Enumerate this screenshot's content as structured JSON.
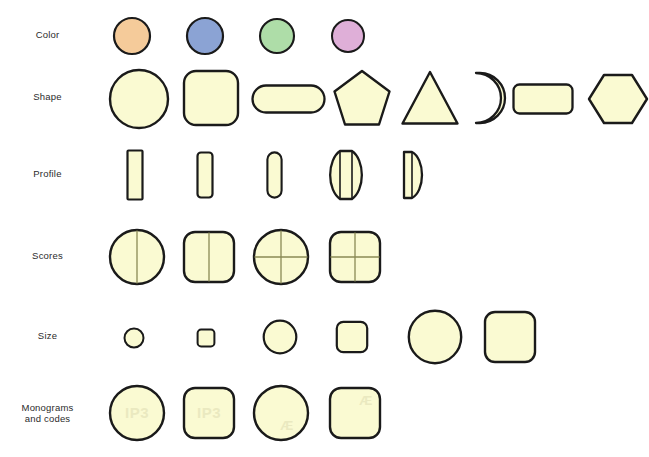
{
  "figure": {
    "background_color": "#ffffff",
    "tablet_fill": "#FAFAD2",
    "tablet_outline": "#1a1a1a",
    "score_line_color": "#8a8a55",
    "monogram_color": "#e8e7bd",
    "label_color": "#2b2b2b"
  },
  "rows": [
    {
      "id": "color",
      "label": "Color",
      "label_line2": "",
      "items": [
        {
          "name": "color-circle-orange",
          "shape": "circle",
          "fill": "#F5CB9A",
          "outline": "#1a1a1a"
        },
        {
          "name": "color-circle-blue",
          "shape": "circle",
          "fill": "#8BA3D4",
          "outline": "#1a1a1a"
        },
        {
          "name": "color-circle-green",
          "shape": "circle",
          "fill": "#AEDDA8",
          "outline": "#1a1a1a"
        },
        {
          "name": "color-circle-purple",
          "shape": "circle",
          "fill": "#DFAFD8",
          "outline": "#1a1a1a"
        }
      ]
    },
    {
      "id": "shape",
      "label": "Shape",
      "label_line2": "",
      "items": [
        {
          "name": "shape-round",
          "shape": "circle"
        },
        {
          "name": "shape-square",
          "shape": "rounded-square"
        },
        {
          "name": "shape-oblong",
          "shape": "capsule"
        },
        {
          "name": "shape-pentagon",
          "shape": "pentagon"
        },
        {
          "name": "shape-triangle",
          "shape": "triangle"
        },
        {
          "name": "shape-half-circle",
          "shape": "half-circle"
        },
        {
          "name": "shape-rectangle",
          "shape": "rectangle"
        },
        {
          "name": "shape-hexagon",
          "shape": "hexagon"
        }
      ]
    },
    {
      "id": "profile",
      "label": "Profile",
      "label_line2": "",
      "items": [
        {
          "name": "profile-flat",
          "shape": "flat-profile"
        },
        {
          "name": "profile-flat-bevelled",
          "shape": "bevelled-profile"
        },
        {
          "name": "profile-capsule",
          "shape": "capsule-profile"
        },
        {
          "name": "profile-biconvex",
          "shape": "biconvex-profile"
        },
        {
          "name": "profile-plano-convex",
          "shape": "plano-convex-profile"
        }
      ]
    },
    {
      "id": "scores",
      "label": "Scores",
      "label_line2": "",
      "items": [
        {
          "name": "score-circle-single",
          "shape": "circle",
          "score": "single"
        },
        {
          "name": "score-square-single",
          "shape": "rounded-square",
          "score": "single"
        },
        {
          "name": "score-circle-cross",
          "shape": "circle",
          "score": "cross"
        },
        {
          "name": "score-square-cross",
          "shape": "rounded-square",
          "score": "cross"
        }
      ]
    },
    {
      "id": "size",
      "label": "Size",
      "label_line2": "",
      "items": [
        {
          "name": "size-circle-small",
          "shape": "circle",
          "size": "small"
        },
        {
          "name": "size-square-small",
          "shape": "rounded-square",
          "size": "small"
        },
        {
          "name": "size-circle-medium",
          "shape": "circle",
          "size": "medium"
        },
        {
          "name": "size-square-medium",
          "shape": "rounded-square",
          "size": "medium"
        },
        {
          "name": "size-circle-large",
          "shape": "circle",
          "size": "large"
        },
        {
          "name": "size-square-large",
          "shape": "rounded-square",
          "size": "large"
        }
      ]
    },
    {
      "id": "monograms",
      "label": "Monograms",
      "label_line2": "and codes",
      "items": [
        {
          "name": "monogram-circle-ip3",
          "shape": "circle",
          "code": "IP3",
          "position": "center"
        },
        {
          "name": "monogram-square-ip3",
          "shape": "rounded-square",
          "code": "IP3",
          "position": "center"
        },
        {
          "name": "monogram-circle-ae",
          "shape": "circle",
          "code": "Æ",
          "position": "bottom-right"
        },
        {
          "name": "monogram-square-ae",
          "shape": "rounded-square",
          "code": "Æ",
          "position": "top-right"
        }
      ]
    }
  ]
}
